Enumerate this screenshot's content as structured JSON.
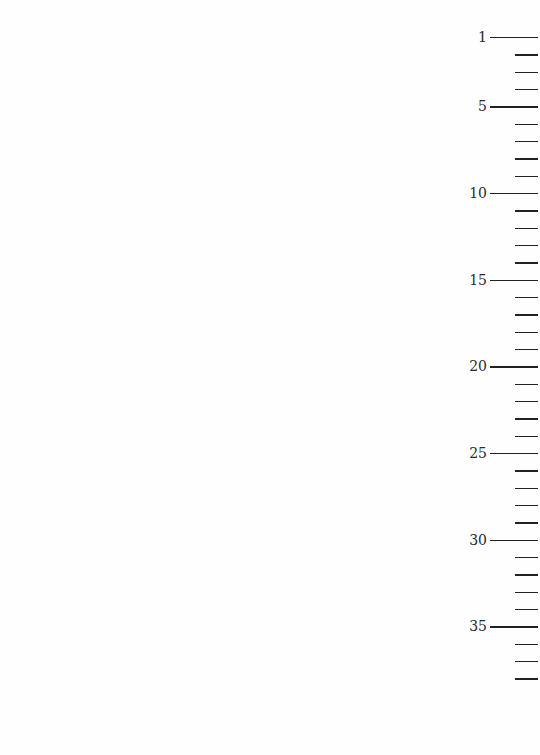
{
  "document": {
    "type": "line-numbered page margin",
    "line_numbers": {
      "first": 1,
      "last": 38,
      "labeled_every": 5,
      "labels": [
        "1",
        "5",
        "10",
        "15",
        "20",
        "25",
        "30",
        "35"
      ],
      "first_y": 37,
      "spacing_px": 17.33
    },
    "ink_color": "#222222",
    "background_color": "#fefefe"
  }
}
